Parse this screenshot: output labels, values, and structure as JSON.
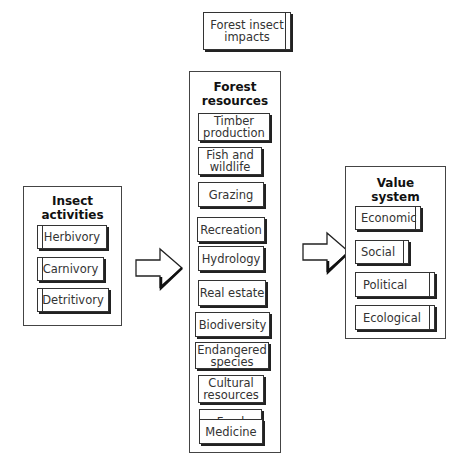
{
  "title_box": {
    "label_line1": "Forest insect",
    "label_line2": "impacts"
  },
  "insect_activities": {
    "title_line1": "Insect",
    "title_line2": "activities",
    "items": [
      {
        "label": "Herbivory"
      },
      {
        "label": "Carnivory"
      },
      {
        "label": "Detritivory"
      }
    ]
  },
  "forest_resources": {
    "title_line1": "Forest",
    "title_line2": "resources",
    "items": [
      {
        "line1": "Timber",
        "line2": "production"
      },
      {
        "line1": "Fish and",
        "line2": "wildlife"
      },
      {
        "line1": "Grazing",
        "line2": ""
      },
      {
        "line1": "Recreation",
        "line2": ""
      },
      {
        "line1": "Hydrology",
        "line2": ""
      },
      {
        "line1": "Real estate",
        "line2": ""
      },
      {
        "line1": "Biodiversity",
        "line2": ""
      },
      {
        "line1": "Endangered",
        "line2": "species"
      },
      {
        "line1": "Cultural",
        "line2": "resources"
      },
      {
        "line1": "Food",
        "line2": ""
      },
      {
        "line1": "Medicine",
        "line2": ""
      }
    ]
  },
  "value_system": {
    "title_line1": "Value",
    "title_line2": "system",
    "items": [
      {
        "label": "Economic"
      },
      {
        "label": "Social"
      },
      {
        "label": "Political"
      },
      {
        "label": "Ecological"
      }
    ]
  },
  "arrows": [
    {
      "from": "Insect activities",
      "to": "Forest resources"
    },
    {
      "from": "Forest resources",
      "to": "Value system"
    }
  ]
}
